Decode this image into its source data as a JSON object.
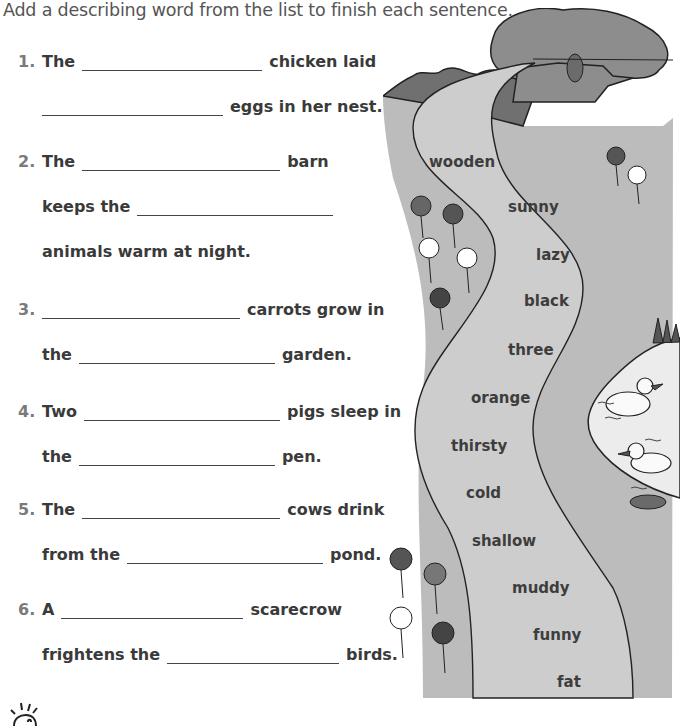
{
  "instructions": "Add a describing word from the list to finish each sentence.",
  "questions": [
    {
      "number": "1.",
      "lines": [
        {
          "before": "The",
          "after": "chicken laid"
        },
        {
          "before": "",
          "after": "eggs in her nest."
        }
      ]
    },
    {
      "number": "2.",
      "lines": [
        {
          "before": "The",
          "after": "barn"
        },
        {
          "before": "keeps the",
          "after": ""
        },
        {
          "text": "animals warm at night."
        }
      ]
    },
    {
      "number": "3.",
      "lines": [
        {
          "before": "",
          "after": "carrots grow in"
        },
        {
          "before": "the",
          "after": "garden."
        }
      ]
    },
    {
      "number": "4.",
      "lines": [
        {
          "before": "Two",
          "after": "pigs sleep in"
        },
        {
          "before": "the",
          "after": "pen."
        }
      ]
    },
    {
      "number": "5.",
      "lines": [
        {
          "before": "The",
          "after": "cows drink"
        },
        {
          "before": "from the",
          "after": "pond."
        }
      ]
    },
    {
      "number": "6.",
      "lines": [
        {
          "before": "A",
          "after": "scarecrow"
        },
        {
          "before": "frightens the",
          "after": "birds."
        }
      ]
    }
  ],
  "word_list": [
    "wooden",
    "sunny",
    "lazy",
    "black",
    "three",
    "orange",
    "thirsty",
    "cold",
    "shallow",
    "muddy",
    "funny",
    "fat"
  ],
  "illustration": {
    "elements": [
      "tree-icon",
      "hills-icon",
      "path",
      "flowers-icon",
      "pond",
      "ducks-icon",
      "grass-icon",
      "lily-pad-icon"
    ]
  },
  "footer": {
    "icon": "lightbulb-icon"
  },
  "colors": {
    "grass": "#b9b9b9",
    "path": "#c8c8c8",
    "tree": "#8a8a8a",
    "hills": "#6f6f6f",
    "pond": "#ececec",
    "outline": "#222222"
  }
}
